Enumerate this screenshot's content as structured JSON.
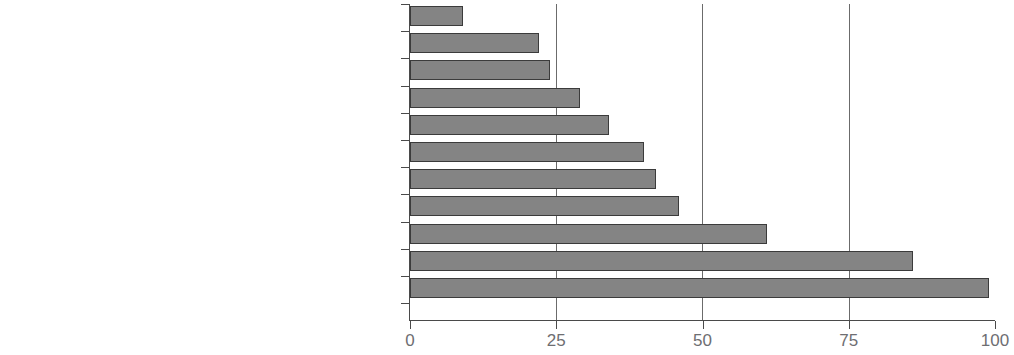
{
  "chart_data": {
    "type": "bar",
    "orientation": "horizontal",
    "title": "",
    "subtitle": "",
    "xlabel": "",
    "ylabel": "",
    "xlim": [
      0,
      100
    ],
    "xticks": [
      0,
      25,
      50,
      75,
      100
    ],
    "xtick_labels": [
      "0",
      "25",
      "50",
      "75",
      "100"
    ],
    "grid": true,
    "gridlines_at": [
      25,
      50,
      75
    ],
    "legend": null,
    "bar_color": "#848484",
    "bar_border_color": "#3b3b3b",
    "label_color": "#76767a",
    "axis_color": "#4a4a4a",
    "categories": [
      "Caribbean",
      "West Asia",
      "Oceania",
      "Middle East",
      "Africa",
      "Central America",
      "North America",
      "Commonwealth of Independendent States (CIS)",
      "South America",
      "East Asia",
      "Europe"
    ],
    "values": [
      9,
      22,
      24,
      29,
      34,
      40,
      42,
      46,
      61,
      86,
      99
    ]
  }
}
